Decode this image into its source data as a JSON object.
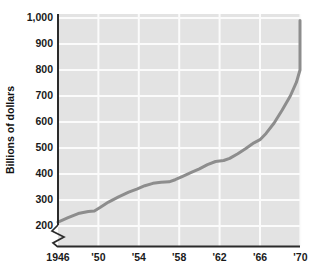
{
  "chart_data": {
    "type": "line",
    "title": "",
    "subtitle": "",
    "xlabel": "",
    "ylabel": "Billions of dollars",
    "xlim": [
      1946,
      1970
    ],
    "ylim": [
      200,
      1000
    ],
    "grid": true,
    "legend": false,
    "legend_position": "none",
    "y_axis_break": true,
    "y_axis_break_symbol": "zigzag",
    "yticks": [
      200,
      300,
      400,
      500,
      600,
      700,
      800,
      900,
      1000
    ],
    "ytick_labels": [
      "200",
      "300",
      "400",
      "500",
      "600",
      "700",
      "800",
      "900",
      "1,000"
    ],
    "xticks": [
      1946,
      1950,
      1954,
      1958,
      1962,
      1966,
      1970
    ],
    "xtick_labels": [
      "1946",
      "'50",
      "'54",
      "'58",
      "'62",
      "'66",
      "'70"
    ],
    "x": [
      1946,
      1947,
      1948,
      1949,
      1950,
      1951,
      1952,
      1953,
      1954,
      1955,
      1956,
      1957,
      1958,
      1959,
      1960,
      1961,
      1962,
      1963,
      1964,
      1965,
      1966,
      1967,
      1968,
      1969,
      1970
    ],
    "values": [
      215,
      232,
      250,
      258,
      260,
      285,
      305,
      330,
      345,
      358,
      368,
      370,
      385,
      405,
      425,
      445,
      450,
      470,
      495,
      525,
      560,
      610,
      665,
      730,
      800
    ],
    "series": [
      {
        "name": "Billions of dollars",
        "color": "#8d8d8d",
        "line_width": 3,
        "points": [
          {
            "x": 1946.0,
            "y": 215
          },
          {
            "x": 1947.0,
            "y": 232
          },
          {
            "x": 1948.0,
            "y": 248
          },
          {
            "x": 1949.0,
            "y": 256
          },
          {
            "x": 1949.6,
            "y": 258
          },
          {
            "x": 1950.2,
            "y": 272
          },
          {
            "x": 1951.0,
            "y": 292
          },
          {
            "x": 1952.0,
            "y": 312
          },
          {
            "x": 1953.0,
            "y": 330
          },
          {
            "x": 1953.8,
            "y": 342
          },
          {
            "x": 1954.6,
            "y": 355
          },
          {
            "x": 1955.4,
            "y": 364
          },
          {
            "x": 1956.2,
            "y": 368
          },
          {
            "x": 1957.0,
            "y": 370
          },
          {
            "x": 1957.6,
            "y": 378
          },
          {
            "x": 1958.4,
            "y": 392
          },
          {
            "x": 1959.2,
            "y": 406
          },
          {
            "x": 1960.0,
            "y": 420
          },
          {
            "x": 1960.8,
            "y": 436
          },
          {
            "x": 1961.6,
            "y": 448
          },
          {
            "x": 1962.4,
            "y": 452
          },
          {
            "x": 1963.0,
            "y": 460
          },
          {
            "x": 1963.8,
            "y": 478
          },
          {
            "x": 1964.6,
            "y": 498
          },
          {
            "x": 1965.4,
            "y": 520
          },
          {
            "x": 1966.0,
            "y": 532
          },
          {
            "x": 1966.6,
            "y": 556
          },
          {
            "x": 1967.4,
            "y": 596
          },
          {
            "x": 1968.2,
            "y": 646
          },
          {
            "x": 1969.0,
            "y": 700
          },
          {
            "x": 1969.6,
            "y": 752
          },
          {
            "x": 1970.2,
            "y": 800
          },
          {
            "x": 1971.0,
            "y": 860
          },
          {
            "x": 1971.8,
            "y": 920
          },
          {
            "x": 1972.6,
            "y": 990
          }
        ]
      }
    ],
    "annotations": [],
    "colors": {
      "plot_background": "#e3e3e3",
      "gridline": "#fbfbfb",
      "line": "#8d8d8d",
      "axis": "#2b2b2b",
      "text": "#1a1a1a",
      "page_background": "#ffffff"
    }
  }
}
